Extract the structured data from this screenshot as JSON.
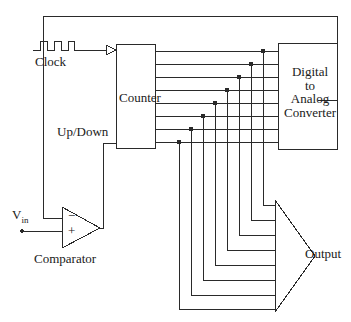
{
  "diagram": {
    "line_color": "#2a2a2a",
    "background_color": "#ffffff",
    "labels": {
      "clock": "Clock",
      "up_down": "Up/Down",
      "counter": "Counter",
      "dac_line1": "Digital",
      "dac_line2": "to",
      "dac_line3": "Analog",
      "dac_line4": "Converter",
      "output": "Output",
      "comparator": "Comparator",
      "vin": "V",
      "vin_sub": "in",
      "comparator_minus": "−",
      "comparator_plus": "+"
    },
    "blocks": [
      {
        "name": "counter",
        "label": "Counter",
        "x": 116,
        "y": 44,
        "width": 39,
        "height": 104
      },
      {
        "name": "dac",
        "label": "Digital to Analog Converter",
        "x": 278,
        "y": 43,
        "width": 59,
        "height": 106
      }
    ],
    "bus": {
      "width_bits": 8,
      "line_ys": [
        51,
        64,
        77,
        90,
        103,
        116,
        129,
        142
      ],
      "tap_xs": [
        179,
        191,
        203,
        215,
        227,
        239,
        251,
        263
      ],
      "from": "counter",
      "to": "dac",
      "junction_dots": 8
    },
    "output_bus": {
      "shape": "arrow",
      "label": "Output",
      "left_x": 275,
      "apex_x": 315,
      "top_y": 200,
      "bottom_y": 312
    },
    "signals": [
      {
        "name": "clock",
        "label": "Clock",
        "symbol": "square-wave",
        "target": "counter"
      },
      {
        "name": "up-down",
        "label": "Up/Down",
        "source": "comparator",
        "target": "counter"
      },
      {
        "name": "vin",
        "label": "Vin",
        "target": "comparator-plus"
      },
      {
        "name": "dac-feedback",
        "label": "",
        "source": "dac",
        "target": "comparator-minus"
      }
    ]
  }
}
